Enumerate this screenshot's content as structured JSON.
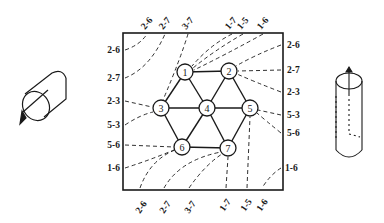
{
  "diagram": {
    "title": "",
    "frame": {
      "x1": 123,
      "y1": 33,
      "x2": 283,
      "y2": 190
    },
    "colors": {
      "ink": "#1a1a1a",
      "background": "#ffffff"
    },
    "nodes": [
      {
        "id": "1",
        "label": "1",
        "x": 185,
        "y": 72
      },
      {
        "id": "2",
        "label": "2",
        "x": 229,
        "y": 71
      },
      {
        "id": "3",
        "label": "3",
        "x": 161,
        "y": 108
      },
      {
        "id": "4",
        "label": "4",
        "x": 207,
        "y": 108
      },
      {
        "id": "5",
        "label": "5",
        "x": 250,
        "y": 108
      },
      {
        "id": "6",
        "label": "6",
        "x": 182,
        "y": 147
      },
      {
        "id": "7",
        "label": "7",
        "x": 228,
        "y": 148
      }
    ],
    "edges": [
      [
        "1",
        "2"
      ],
      [
        "1",
        "3"
      ],
      [
        "1",
        "4"
      ],
      [
        "2",
        "4"
      ],
      [
        "2",
        "5"
      ],
      [
        "3",
        "4"
      ],
      [
        "4",
        "5"
      ],
      [
        "3",
        "6"
      ],
      [
        "4",
        "6"
      ],
      [
        "4",
        "7"
      ],
      [
        "5",
        "7"
      ],
      [
        "6",
        "7"
      ]
    ],
    "left_labels": [
      {
        "text": "2-6",
        "y": 50
      },
      {
        "text": "2-7",
        "y": 78
      },
      {
        "text": "2-3",
        "y": 101
      },
      {
        "text": "5-3",
        "y": 125
      },
      {
        "text": "5-6",
        "y": 145
      },
      {
        "text": "1-6",
        "y": 168
      }
    ],
    "right_labels": [
      {
        "text": "2-6",
        "y": 45
      },
      {
        "text": "2-7",
        "y": 70
      },
      {
        "text": "2-3",
        "y": 92
      },
      {
        "text": "5-3",
        "y": 115
      },
      {
        "text": "5-6",
        "y": 133
      },
      {
        "text": "1-6",
        "y": 168
      }
    ],
    "top_labels": [
      {
        "text": "2-6",
        "x": 147
      },
      {
        "text": "2-7",
        "x": 165
      },
      {
        "text": "3-7",
        "x": 188
      },
      {
        "text": "1-7",
        "x": 232
      },
      {
        "text": "1-5",
        "x": 243
      },
      {
        "text": "1-6",
        "x": 263
      }
    ],
    "bottom_labels": [
      {
        "text": "2-6",
        "x": 140
      },
      {
        "text": "2-7",
        "x": 164
      },
      {
        "text": "3-7",
        "x": 189
      },
      {
        "text": "1-7",
        "x": 226
      },
      {
        "text": "1-5",
        "x": 247
      },
      {
        "text": "1-6",
        "x": 262
      }
    ],
    "side_figures": {
      "left": "horizontal-cylinder-with-circular-arrow",
      "right": "vertical-cylinder-with-arrow"
    }
  }
}
